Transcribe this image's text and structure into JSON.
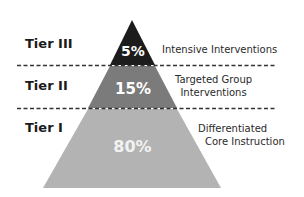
{
  "diagram": {
    "type": "pyramid",
    "tiers": [
      {
        "name": "Tier III",
        "percent": "5%",
        "description_line1": "Intensive Interventions",
        "description_line2": "",
        "color": "#1c1c1c",
        "text_color": "#ffffff"
      },
      {
        "name": "Tier II",
        "percent": "15%",
        "description_line1": "Targeted Group",
        "description_line2": "Interventions",
        "color": "#7b7b7b",
        "text_color": "#ffffff"
      },
      {
        "name": "Tier I",
        "percent": "80%",
        "description_line1": "Differentiated",
        "description_line2": "Core Instruction",
        "color": "#b3b3b3",
        "text_color": "#f2f2f2"
      }
    ],
    "divider_style": "dashed",
    "divider_color": "#333333"
  }
}
